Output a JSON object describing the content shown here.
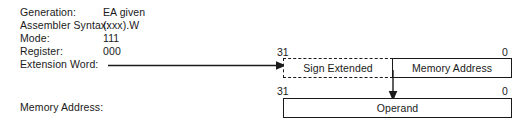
{
  "diagram": {
    "attributes": [
      {
        "label": "Generation:",
        "value": "EA given"
      },
      {
        "label": "Assembler Syntax:",
        "value": "(xxx).W"
      },
      {
        "label": "Mode:",
        "value": "111"
      },
      {
        "label": "Register:",
        "value": "000"
      },
      {
        "label": "Extension Word:",
        "value": ""
      }
    ],
    "memory_address_label": "Memory Address:",
    "upper_word": {
      "bit_high": "31",
      "bit_low": "0",
      "fields": [
        {
          "name": "sign-extended",
          "label": "Sign Extended",
          "border": "dashed"
        },
        {
          "name": "memory-address",
          "label": "Memory Address",
          "border": "solid"
        }
      ]
    },
    "lower_word": {
      "bit_high": "31",
      "bit_low": "0",
      "fields": [
        {
          "name": "operand",
          "label": "Operand",
          "border": "solid"
        }
      ]
    },
    "connectors": [
      {
        "name": "extension-word-connector",
        "direction": "right"
      },
      {
        "name": "address-to-operand-connector",
        "direction": "down"
      }
    ],
    "colors": {
      "ink": "#1a1a1a",
      "background": "#ffffff"
    }
  }
}
